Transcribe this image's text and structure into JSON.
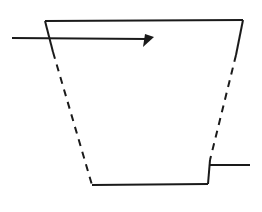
{
  "canvas": {
    "width": 262,
    "height": 212,
    "background_color": "#FFFFFF"
  },
  "style": {
    "line_color": "#1A1A1A",
    "line_width": 2,
    "dash_pattern": "7 6"
  },
  "figure": {
    "name": "trapezoid-with-arrow",
    "shapes": [
      {
        "id": "top-edge",
        "name": "trapezoid-top-edge",
        "type": "line",
        "style": "solid",
        "points": [
          [
            45,
            21
          ],
          [
            243,
            20
          ]
        ]
      },
      {
        "id": "bottom-edge",
        "name": "trapezoid-bottom-edge",
        "type": "line",
        "style": "solid",
        "points": [
          [
            92,
            185
          ],
          [
            208,
            184
          ]
        ]
      },
      {
        "id": "left-side-solid-top",
        "name": "trapezoid-left-side-visible",
        "type": "line",
        "style": "solid",
        "points": [
          [
            45,
            21
          ],
          [
            53,
            52
          ]
        ]
      },
      {
        "id": "left-side-dashed",
        "name": "trapezoid-left-side-hidden",
        "type": "line",
        "style": "dashed",
        "points": [
          [
            53,
            52
          ],
          [
            92,
            185
          ]
        ]
      },
      {
        "id": "right-side-solid-top",
        "name": "trapezoid-right-side-visible-top",
        "type": "line",
        "style": "solid",
        "points": [
          [
            243,
            20
          ],
          [
            236,
            55
          ]
        ]
      },
      {
        "id": "right-side-dashed",
        "name": "trapezoid-right-side-hidden",
        "type": "line",
        "style": "dashed",
        "points": [
          [
            236,
            55
          ],
          [
            210,
            160
          ]
        ]
      },
      {
        "id": "right-side-solid-bottom",
        "name": "trapezoid-right-side-visible-bottom",
        "type": "line",
        "style": "solid",
        "points": [
          [
            210,
            160
          ],
          [
            208,
            184
          ]
        ]
      },
      {
        "id": "left-leader-line",
        "name": "arrow-shaft-left",
        "type": "line",
        "style": "solid",
        "points": [
          [
            12,
            38
          ],
          [
            147,
            39
          ]
        ]
      },
      {
        "id": "right-leader-line",
        "name": "leader-line-right",
        "type": "line",
        "style": "solid",
        "points": [
          [
            209,
            165
          ],
          [
            250,
            165
          ]
        ]
      }
    ],
    "arrowhead": {
      "name": "arrow-head-filled-triangle",
      "type": "filled-triangle",
      "tip": [
        154,
        37
      ],
      "base_a": [
        143,
        47
      ],
      "base_b": [
        145,
        34
      ],
      "fill_color": "#1A1A1A"
    }
  }
}
